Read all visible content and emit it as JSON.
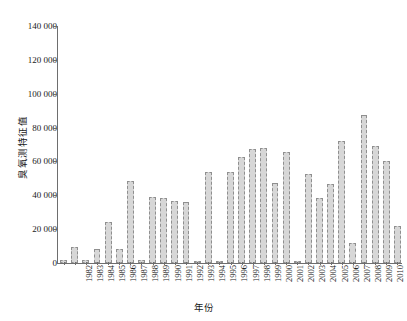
{
  "chart_data": {
    "type": "bar",
    "title": "",
    "xlabel": "年份",
    "ylabel": "臭氧测特征值",
    "ylim": [
      0,
      140000
    ],
    "ytick_step": 20000,
    "grid": false,
    "legend": null,
    "bar_fill_color": "#d7d7d7",
    "bar_border_color": "#8f8f8f",
    "axis_color": "#6e6e6e",
    "ytick_labels": [
      "0",
      "20 000",
      "40 000",
      "60 000",
      "80 000",
      "100 000",
      "120 000",
      "140 000"
    ],
    "ytick_values": [
      0,
      20000,
      40000,
      60000,
      80000,
      100000,
      120000,
      140000
    ],
    "categories": [
      "1982",
      "1983",
      "1984",
      "1985",
      "1986",
      "1987",
      "1988",
      "1989",
      "1990",
      "1991",
      "1992",
      "1993",
      "1994",
      "1995",
      "1996",
      "1997",
      "1998",
      "1999",
      "2000",
      "2001",
      "2002",
      "2003",
      "2004",
      "2005",
      "2006",
      "2007",
      "2008",
      "2009",
      "2010",
      "2011",
      "2012"
    ],
    "values": [
      1500,
      9500,
      2000,
      8000,
      24000,
      8500,
      48500,
      2000,
      39000,
      38500,
      36500,
      36000,
      1000,
      54000,
      1000,
      54000,
      62500,
      67500,
      68000,
      47000,
      65500,
      1000,
      52500,
      38500,
      46500,
      72000,
      12000,
      87500,
      69000,
      60000,
      22000
    ]
  }
}
